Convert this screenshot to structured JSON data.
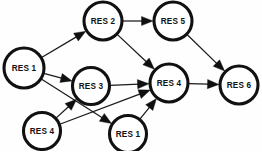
{
  "figure": {
    "background_color": "#ffffff",
    "node_fill": "#ffffff",
    "node_stroke": "#111111",
    "edge_color": "#1a1a1a",
    "width": 262,
    "height": 151
  },
  "nodes": [
    {
      "id": "n1",
      "label": "RES 1",
      "cx": 24,
      "cy": 68,
      "r": 20
    },
    {
      "id": "n2",
      "label": "RES 2",
      "cx": 103,
      "cy": 21,
      "r": 19
    },
    {
      "id": "n3",
      "label": "RES 3",
      "cx": 91,
      "cy": 86,
      "r": 18.5
    },
    {
      "id": "n4",
      "label": "RES 4",
      "cx": 169,
      "cy": 83,
      "r": 19
    },
    {
      "id": "n5",
      "label": "RES 5",
      "cx": 173,
      "cy": 21,
      "r": 19
    },
    {
      "id": "n6",
      "label": "RES 6",
      "cx": 239,
      "cy": 85,
      "r": 19
    },
    {
      "id": "n7",
      "label": "RES 4",
      "cx": 42,
      "cy": 131,
      "r": 18.5
    },
    {
      "id": "n8",
      "label": "RES 1",
      "cx": 128,
      "cy": 134,
      "r": 18.5
    }
  ],
  "edges": [
    {
      "id": "e1",
      "from": "n1",
      "to": "n2",
      "from_label": "RES 1",
      "to_label": "RES 2"
    },
    {
      "id": "e2",
      "from": "n1",
      "to": "n3",
      "from_label": "RES 1",
      "to_label": "RES 3"
    },
    {
      "id": "e3",
      "from": "n1",
      "to": "n8",
      "from_label": "RES 1",
      "to_label": "RES 1"
    },
    {
      "id": "e4",
      "from": "n2",
      "to": "n5",
      "from_label": "RES 2",
      "to_label": "RES 5"
    },
    {
      "id": "e5",
      "from": "n2",
      "to": "n4",
      "from_label": "RES 2",
      "to_label": "RES 4"
    },
    {
      "id": "e6",
      "from": "n3",
      "to": "n4",
      "from_label": "RES 3",
      "to_label": "RES 4"
    },
    {
      "id": "e7",
      "from": "n5",
      "to": "n6",
      "from_label": "RES 5",
      "to_label": "RES 6"
    },
    {
      "id": "e8",
      "from": "n4",
      "to": "n6",
      "from_label": "RES 4",
      "to_label": "RES 6"
    },
    {
      "id": "e9",
      "from": "n7",
      "to": "n3",
      "from_label": "RES 4",
      "to_label": "RES 3"
    },
    {
      "id": "e10",
      "from": "n7",
      "to": "n4",
      "from_label": "RES 4",
      "to_label": "RES 4"
    },
    {
      "id": "e11",
      "from": "n8",
      "to": "n4",
      "from_label": "RES 1",
      "to_label": "RES 4"
    }
  ]
}
